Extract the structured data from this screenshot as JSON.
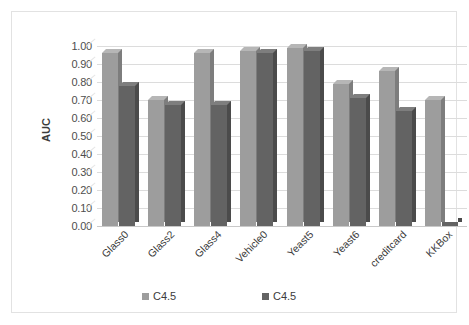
{
  "chart_data": {
    "type": "bar",
    "title": "",
    "xlabel": "",
    "ylabel": "AUC",
    "ylim": [
      0.0,
      1.0
    ],
    "ytick_step": 0.1,
    "grid": true,
    "legend_position": "bottom",
    "categories": [
      "Glass0",
      "Glass2",
      "Glass4",
      "Vehicle0",
      "Yeast5",
      "Yeast6",
      "creditcard",
      "KKBox"
    ],
    "ytick_labels": [
      "1.00",
      "0.90",
      "0.80",
      "0.70",
      "0.60",
      "0.50",
      "0.40",
      "0.30",
      "0.20",
      "0.10",
      "0.00"
    ],
    "series": [
      {
        "name": "C4.5",
        "color": "#9d9d9d",
        "values": [
          0.96,
          0.7,
          0.96,
          0.97,
          0.99,
          0.79,
          0.86,
          0.7
        ]
      },
      {
        "name": "C4.5",
        "color": "#636363",
        "values": [
          0.78,
          0.67,
          0.67,
          0.96,
          0.97,
          0.71,
          0.64,
          0.02
        ]
      }
    ]
  },
  "legend": {
    "items": [
      {
        "label": "C4.5",
        "color": "#9d9d9d"
      },
      {
        "label": "C4.5",
        "color": "#636363"
      }
    ]
  },
  "colors": {
    "frame_border": "#e2e2e2",
    "gridline": "#dcdcdc",
    "axis_text": "#4d4d4d",
    "background": "#ffffff"
  }
}
